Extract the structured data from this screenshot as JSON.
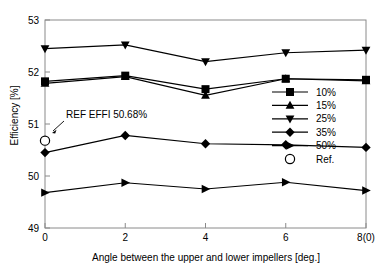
{
  "chart_data": {
    "type": "line",
    "title": "",
    "xlabel": "Angle between the upper and lower impellers [deg.]",
    "ylabel": "Efficiency [%]",
    "x": [
      0,
      2,
      4,
      6,
      8
    ],
    "xtick_labels": [
      "0",
      "2",
      "4",
      "6",
      "8(0)"
    ],
    "ytick_labels": [
      "49",
      "50",
      "51",
      "52",
      "53"
    ],
    "xlim": [
      0,
      8
    ],
    "ylim": [
      49,
      53
    ],
    "grid": false,
    "legend_position": "center-right",
    "series": [
      {
        "name": "10%",
        "marker": "square",
        "values": [
          51.82,
          51.93,
          51.67,
          51.87,
          51.85
        ]
      },
      {
        "name": "15%",
        "marker": "triangle-up",
        "values": [
          51.78,
          51.91,
          51.55,
          51.87,
          51.83
        ]
      },
      {
        "name": "25%",
        "marker": "triangle-down",
        "values": [
          52.45,
          52.52,
          52.2,
          52.37,
          52.42
        ]
      },
      {
        "name": "35%",
        "marker": "diamond",
        "values": [
          50.45,
          50.78,
          50.62,
          50.6,
          50.55
        ]
      },
      {
        "name": "50%",
        "marker": "triangle-right",
        "values": [
          49.68,
          49.87,
          49.75,
          49.88,
          49.72
        ]
      }
    ],
    "reference": {
      "name": "Ref.",
      "marker": "circle-open",
      "x": 0,
      "y": 50.68,
      "annotation": "REF EFFI 50.68%"
    },
    "legend_entries": [
      "10%",
      "15%",
      "25%",
      "35%",
      "50%",
      "Ref."
    ],
    "colors": {
      "line": "#000000",
      "marker": "#000000",
      "axis": "#808080",
      "background": "#ffffff"
    }
  },
  "labels": {
    "annotation": "REF EFFI 50.68%"
  }
}
